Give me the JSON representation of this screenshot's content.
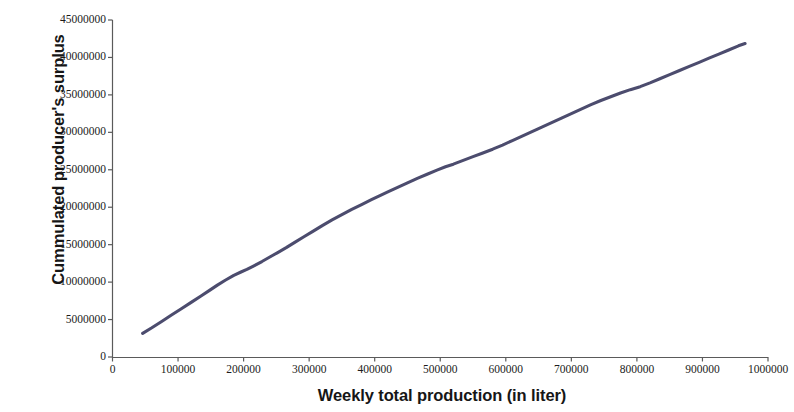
{
  "chart_data": {
    "type": "line",
    "title": "",
    "xlabel": "Weekly total production (in liter)",
    "ylabel": "Cummulated producer's surplus",
    "xlim": [
      0,
      1000000
    ],
    "ylim": [
      0,
      45000000
    ],
    "grid": false,
    "legend": "none",
    "line_color": "#4c4c6e",
    "x_ticks": [
      "0",
      "100000",
      "200000",
      "300000",
      "400000",
      "500000",
      "600000",
      "700000",
      "800000",
      "900000",
      "1000000"
    ],
    "x_tick_values": [
      0,
      100000,
      200000,
      300000,
      400000,
      500000,
      600000,
      700000,
      800000,
      900000,
      1000000
    ],
    "y_ticks": [
      "0",
      "5000000",
      "10000000",
      "15000000",
      "20000000",
      "25000000",
      "30000000",
      "35000000",
      "40000000",
      "45000000"
    ],
    "y_tick_values": [
      0,
      5000000,
      10000000,
      15000000,
      20000000,
      25000000,
      30000000,
      35000000,
      40000000,
      45000000
    ],
    "series": [
      {
        "name": "Cummulated producer's surplus",
        "x": [
          46000,
          60000,
          75000,
          90000,
          105000,
          120000,
          135000,
          148000,
          160000,
          172000,
          185000,
          196000,
          205000,
          215000,
          228000,
          240000,
          252000,
          265000,
          278000,
          292000,
          305000,
          320000,
          335000,
          350000,
          365000,
          380000,
          395000,
          408000,
          420000,
          435000,
          450000,
          465000,
          480000,
          495000,
          508000,
          520000,
          535000,
          550000,
          565000,
          580000,
          595000,
          610000,
          625000,
          640000,
          655000,
          670000,
          685000,
          700000,
          715000,
          730000,
          745000,
          760000,
          775000,
          790000,
          805000,
          820000,
          835000,
          850000,
          865000,
          880000,
          895000,
          910000,
          925000,
          940000,
          955000,
          965000
        ],
        "y": [
          3150000,
          3900000,
          4750000,
          5600000,
          6450000,
          7300000,
          8150000,
          8900000,
          9600000,
          10250000,
          10900000,
          11350000,
          11700000,
          12150000,
          12750000,
          13350000,
          13950000,
          14600000,
          15300000,
          16050000,
          16750000,
          17550000,
          18300000,
          19000000,
          19700000,
          20350000,
          21000000,
          21550000,
          22050000,
          22650000,
          23250000,
          23850000,
          24400000,
          24950000,
          25400000,
          25750000,
          26250000,
          26750000,
          27250000,
          27750000,
          28300000,
          28900000,
          29500000,
          30100000,
          30700000,
          31300000,
          31900000,
          32500000,
          33100000,
          33700000,
          34250000,
          34750000,
          35250000,
          35700000,
          36100000,
          36600000,
          37150000,
          37700000,
          38250000,
          38800000,
          39350000,
          39900000,
          40450000,
          41000000,
          41550000,
          41850000
        ]
      }
    ]
  }
}
